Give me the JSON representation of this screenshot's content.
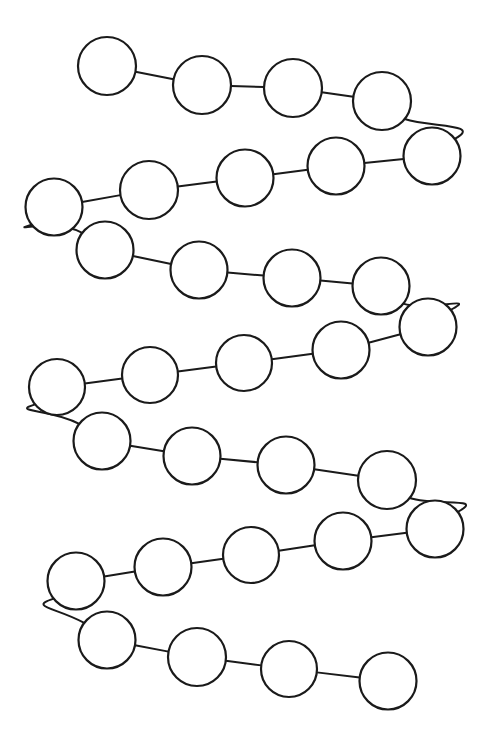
{
  "figure": {
    "background_color": "#ffffff",
    "stroke_color": "#1a1a1a",
    "node_fill_color": "#ffffff",
    "node_stroke_width": 2.2,
    "link_stroke_width": 2.0,
    "canvas": {
      "width": 491,
      "height": 745
    },
    "node_count": 31,
    "link_count": 30,
    "row_count": 7,
    "default_radius": 28.5
  },
  "chart_data": {
    "type": "scatter",
    "xlabel": "",
    "ylabel": "",
    "xlim": [
      0,
      491
    ],
    "ylim": [
      0,
      745
    ],
    "grid": false,
    "legend": "none",
    "nodes": [
      {
        "id": 1,
        "row": 1,
        "cx": 107,
        "cy": 66,
        "r": 29.0
      },
      {
        "id": 2,
        "row": 1,
        "cx": 202,
        "cy": 85,
        "r": 29.0
      },
      {
        "id": 3,
        "row": 1,
        "cx": 293,
        "cy": 88,
        "r": 29.0
      },
      {
        "id": 4,
        "row": 1,
        "cx": 382,
        "cy": 101,
        "r": 29.0
      },
      {
        "id": 5,
        "row": 2,
        "cx": 432,
        "cy": 156,
        "r": 28.5
      },
      {
        "id": 6,
        "row": 2,
        "cx": 336,
        "cy": 166,
        "r": 28.5
      },
      {
        "id": 7,
        "row": 2,
        "cx": 245,
        "cy": 178,
        "r": 28.5
      },
      {
        "id": 8,
        "row": 2,
        "cx": 149,
        "cy": 190,
        "r": 29.0
      },
      {
        "id": 9,
        "row": 2,
        "cx": 54,
        "cy": 207,
        "r": 28.5
      },
      {
        "id": 10,
        "row": 3,
        "cx": 105,
        "cy": 250,
        "r": 28.5
      },
      {
        "id": 11,
        "row": 3,
        "cx": 199,
        "cy": 270,
        "r": 28.5
      },
      {
        "id": 12,
        "row": 3,
        "cx": 292,
        "cy": 278,
        "r": 28.5
      },
      {
        "id": 13,
        "row": 3,
        "cx": 381,
        "cy": 286,
        "r": 28.5
      },
      {
        "id": 14,
        "row": 4,
        "cx": 428,
        "cy": 327,
        "r": 28.5
      },
      {
        "id": 15,
        "row": 4,
        "cx": 341,
        "cy": 350,
        "r": 28.5
      },
      {
        "id": 16,
        "row": 4,
        "cx": 244,
        "cy": 363,
        "r": 28.0
      },
      {
        "id": 17,
        "row": 4,
        "cx": 150,
        "cy": 375,
        "r": 28.0
      },
      {
        "id": 18,
        "row": 4,
        "cx": 57,
        "cy": 387,
        "r": 28.0
      },
      {
        "id": 19,
        "row": 5,
        "cx": 102,
        "cy": 441,
        "r": 28.5
      },
      {
        "id": 20,
        "row": 5,
        "cx": 192,
        "cy": 456,
        "r": 28.5
      },
      {
        "id": 21,
        "row": 5,
        "cx": 286,
        "cy": 465,
        "r": 28.5
      },
      {
        "id": 22,
        "row": 5,
        "cx": 387,
        "cy": 480,
        "r": 29.0
      },
      {
        "id": 23,
        "row": 6,
        "cx": 435,
        "cy": 529,
        "r": 28.5
      },
      {
        "id": 24,
        "row": 6,
        "cx": 343,
        "cy": 541,
        "r": 28.5
      },
      {
        "id": 25,
        "row": 6,
        "cx": 251,
        "cy": 555,
        "r": 28.0
      },
      {
        "id": 26,
        "row": 6,
        "cx": 163,
        "cy": 567,
        "r": 28.5
      },
      {
        "id": 27,
        "row": 6,
        "cx": 76,
        "cy": 581,
        "r": 28.5
      },
      {
        "id": 28,
        "row": 7,
        "cx": 107,
        "cy": 640,
        "r": 28.5
      },
      {
        "id": 29,
        "row": 7,
        "cx": 197,
        "cy": 657,
        "r": 29.0
      },
      {
        "id": 30,
        "row": 7,
        "cx": 289,
        "cy": 669,
        "r": 28.0
      },
      {
        "id": 31,
        "row": 7,
        "cx": 388,
        "cy": 681,
        "r": 28.5
      }
    ],
    "links": [
      {
        "from": 1,
        "to": 2,
        "kind": "straight"
      },
      {
        "from": 2,
        "to": 3,
        "kind": "straight"
      },
      {
        "from": 3,
        "to": 4,
        "kind": "straight"
      },
      {
        "from": 4,
        "to": 5,
        "kind": "turn-right"
      },
      {
        "from": 5,
        "to": 6,
        "kind": "straight"
      },
      {
        "from": 6,
        "to": 7,
        "kind": "straight"
      },
      {
        "from": 7,
        "to": 8,
        "kind": "straight"
      },
      {
        "from": 8,
        "to": 9,
        "kind": "straight"
      },
      {
        "from": 9,
        "to": 10,
        "kind": "turn-left"
      },
      {
        "from": 10,
        "to": 11,
        "kind": "straight"
      },
      {
        "from": 11,
        "to": 12,
        "kind": "straight"
      },
      {
        "from": 12,
        "to": 13,
        "kind": "straight"
      },
      {
        "from": 13,
        "to": 14,
        "kind": "turn-right"
      },
      {
        "from": 14,
        "to": 15,
        "kind": "straight"
      },
      {
        "from": 15,
        "to": 16,
        "kind": "straight"
      },
      {
        "from": 16,
        "to": 17,
        "kind": "straight"
      },
      {
        "from": 17,
        "to": 18,
        "kind": "straight"
      },
      {
        "from": 18,
        "to": 19,
        "kind": "turn-left"
      },
      {
        "from": 19,
        "to": 20,
        "kind": "straight"
      },
      {
        "from": 20,
        "to": 21,
        "kind": "straight"
      },
      {
        "from": 21,
        "to": 22,
        "kind": "straight"
      },
      {
        "from": 22,
        "to": 23,
        "kind": "turn-right"
      },
      {
        "from": 23,
        "to": 24,
        "kind": "straight"
      },
      {
        "from": 24,
        "to": 25,
        "kind": "straight"
      },
      {
        "from": 25,
        "to": 26,
        "kind": "straight"
      },
      {
        "from": 26,
        "to": 27,
        "kind": "straight"
      },
      {
        "from": 27,
        "to": 28,
        "kind": "turn-left"
      },
      {
        "from": 28,
        "to": 29,
        "kind": "straight"
      },
      {
        "from": 29,
        "to": 30,
        "kind": "straight"
      },
      {
        "from": 30,
        "to": 31,
        "kind": "straight"
      }
    ],
    "turn_controls": {
      "turn-right": {
        "bulge_x": 36,
        "bulge_y": -4
      },
      "turn-left": {
        "bulge_x": -36,
        "bulge_y": -4
      }
    }
  }
}
